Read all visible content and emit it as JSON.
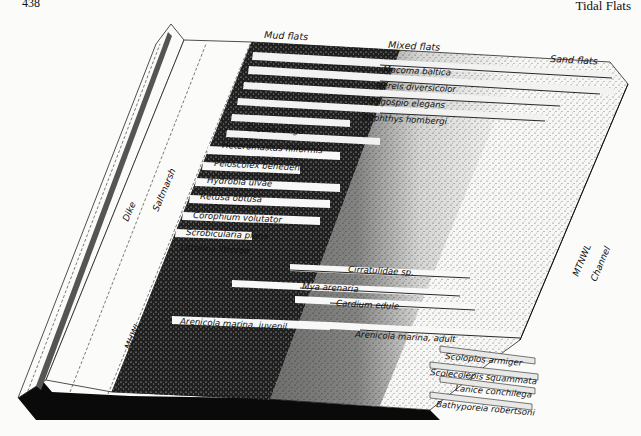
{
  "page": {
    "number": "438",
    "running_head": "Tidal Flats"
  },
  "figure": {
    "zones": {
      "mud": "Mud flats",
      "mixed": "Mixed flats",
      "sand": "Sand flats"
    },
    "side_labels": {
      "dike": "Dike",
      "saltmarsh": "Saltmarsh",
      "mhwl": "MHWL",
      "mtnwl": "MTNWL",
      "channel": "Channel"
    },
    "species": [
      {
        "name": "Macoma baltica"
      },
      {
        "name": "Nereis diversicolor"
      },
      {
        "name": "Pygospio elegans"
      },
      {
        "name": "Nephthys hombergi"
      },
      {
        "name": "Eteone longa"
      },
      {
        "name": "Heteromastus filiformis"
      },
      {
        "name": "Peloscolex benedeni"
      },
      {
        "name": "Hydrobia ulvae"
      },
      {
        "name": "Retusa obtusa"
      },
      {
        "name": "Corophium volutator"
      },
      {
        "name": "Scrobicularia plana"
      },
      {
        "name": "Littorina littorea"
      },
      {
        "name": "Cirratulidae sp."
      },
      {
        "name": "Mya arenaria"
      },
      {
        "name": "Cardium edule"
      },
      {
        "name": "Arenicola marina, juvenil"
      },
      {
        "name": "Arenicola marina, adult"
      },
      {
        "name": "Scoloplos armiger"
      },
      {
        "name": "Scolecolepis squammata"
      },
      {
        "name": "Lanice conchilega"
      },
      {
        "name": "Bathyporeia robertsoni"
      }
    ]
  }
}
